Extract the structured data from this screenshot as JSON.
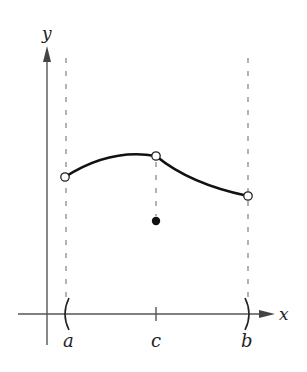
{
  "figure": {
    "type": "function-limit-diagram",
    "axes": {
      "x_label": "x",
      "y_label": "y"
    },
    "ticks": {
      "a_label": "a",
      "c_label": "c",
      "b_label": "b"
    },
    "points": {
      "left_open": {
        "label": "open circle at x = a",
        "style": "open"
      },
      "middle_open": {
        "label": "open circle at x = c",
        "style": "open"
      },
      "filled": {
        "label": "f(c) filled point",
        "style": "filled"
      },
      "right_open": {
        "label": "open circle at x = b",
        "style": "open"
      }
    },
    "interval": {
      "left_bracket": "(",
      "right_bracket": ")"
    },
    "colors": {
      "curve": "#111111",
      "axis": "#555555",
      "dashed": "#888888",
      "background": "#ffffff"
    }
  }
}
